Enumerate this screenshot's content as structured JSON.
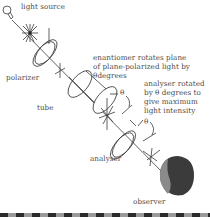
{
  "diagram": {
    "labels": {
      "light_source": "light source",
      "polarizer": "polarizer",
      "tube": "tube",
      "enantiomer_line1": "enantiomer rotates plane",
      "enantiomer_line2": "of plane-polarized light by",
      "enantiomer_line3": "θdegrees",
      "analyser_note_line1": "analyser rotated",
      "analyser_note_line2": "by θ degrees to",
      "analyser_note_line3": "give maximum",
      "analyser_note_line4": "light intensity",
      "theta_1": "θ",
      "theta_2": "θ",
      "analyser": "analyser",
      "observer": "observer"
    },
    "components": [
      "light-bulb",
      "unpolarized-light-star",
      "polarizer-disc",
      "sample-tube",
      "polarized-light-cross",
      "analyser-disc",
      "rotated-light-cross",
      "observer-head"
    ],
    "colors": {
      "line": "#3a3a3a",
      "text": "#4a4a4a",
      "head_dark": "#3b3b3b",
      "head_light": "#8a8a8a",
      "strip_dark": "#2b2b2b",
      "strip_light": "#9a9a9a"
    }
  }
}
